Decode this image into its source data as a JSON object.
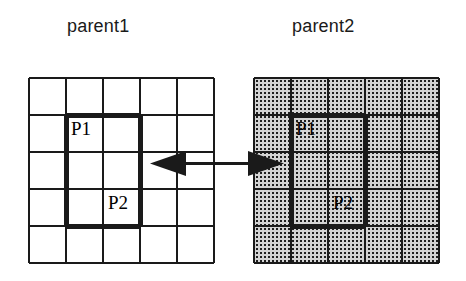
{
  "figure": {
    "type": "crossover-diagram"
  },
  "titles": {
    "left": "parent1",
    "right": "parent2"
  },
  "grid": {
    "rows": 5,
    "cols": 5,
    "cell_size": 37,
    "thin_line_width": 2,
    "bold_line_width": 4,
    "line_color": "#1a1a1a"
  },
  "block": {
    "col_start": 1,
    "col_end": 3,
    "row_start": 1,
    "row_end": 4,
    "corner_labels": {
      "top_left": "P1",
      "bottom_right": "P2"
    }
  },
  "left_panel": {
    "name": "parent1",
    "fill": "#ffffff",
    "pattern": "none",
    "labels": {
      "p1": "P1",
      "p2": "P2"
    }
  },
  "right_panel": {
    "name": "parent2",
    "fill": "#d0d0d0",
    "pattern": "dotted-halftone",
    "labels": {
      "p1": "P1",
      "p2": "P2"
    }
  },
  "arrow": {
    "kind": "double-headed",
    "color": "#1a1a1a",
    "direction": "bidirectional",
    "left_tip_x": 150,
    "right_tip_x": 282,
    "center_y": 163
  },
  "colors": {
    "ink": "#1a1a1a",
    "paper": "#ffffff",
    "shade": "#d0d0d0"
  }
}
